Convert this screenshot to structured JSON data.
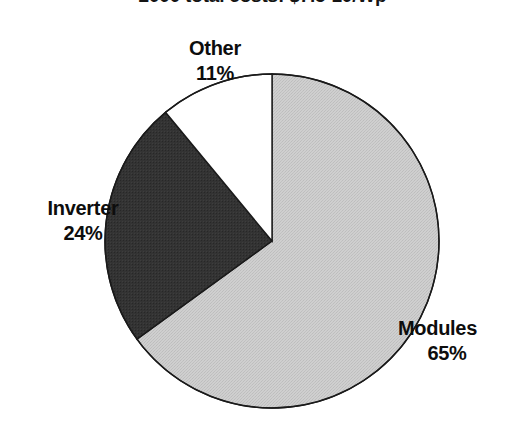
{
  "figure": {
    "width": 525,
    "height": 438,
    "background": "#ffffff",
    "title": "2000 total costs: $7.5-10/Wp",
    "title_clipped": true
  },
  "labels": {
    "other": {
      "name": "Other",
      "value": "11%"
    },
    "inverter": {
      "name": "Inverter",
      "value": "24%"
    },
    "modules": {
      "name": "Modules",
      "value": "65%"
    }
  },
  "chart_data": {
    "type": "pie",
    "title": "2000 total costs: $7.5-10/Wp",
    "xlabel": "",
    "ylabel": "",
    "grid": false,
    "legend": "none",
    "labels_position": "outside",
    "start_angle_deg": 0,
    "direction": "clockwise",
    "center": {
      "x": 272,
      "y": 241
    },
    "radius": 167,
    "stroke": "#1a1a1a",
    "stroke_width": 1.4,
    "categories": [
      "Modules",
      "Inverter",
      "Other"
    ],
    "values": [
      65,
      24,
      11
    ],
    "units": "percent",
    "total": 100,
    "slices": [
      {
        "label": "Modules",
        "value": 65,
        "display_value": "65%",
        "color": "#c9c9c9",
        "fill_style": "light-gray-halftone",
        "start_deg": 0,
        "end_deg": 234
      },
      {
        "label": "Inverter",
        "value": 24,
        "display_value": "24%",
        "color": "#333333",
        "fill_style": "dark-gray-halftone",
        "start_deg": 234,
        "end_deg": 320.4
      },
      {
        "label": "Other",
        "value": 11,
        "display_value": "11%",
        "color": "#ffffff",
        "fill_style": "white",
        "start_deg": 320.4,
        "end_deg": 360
      }
    ]
  }
}
